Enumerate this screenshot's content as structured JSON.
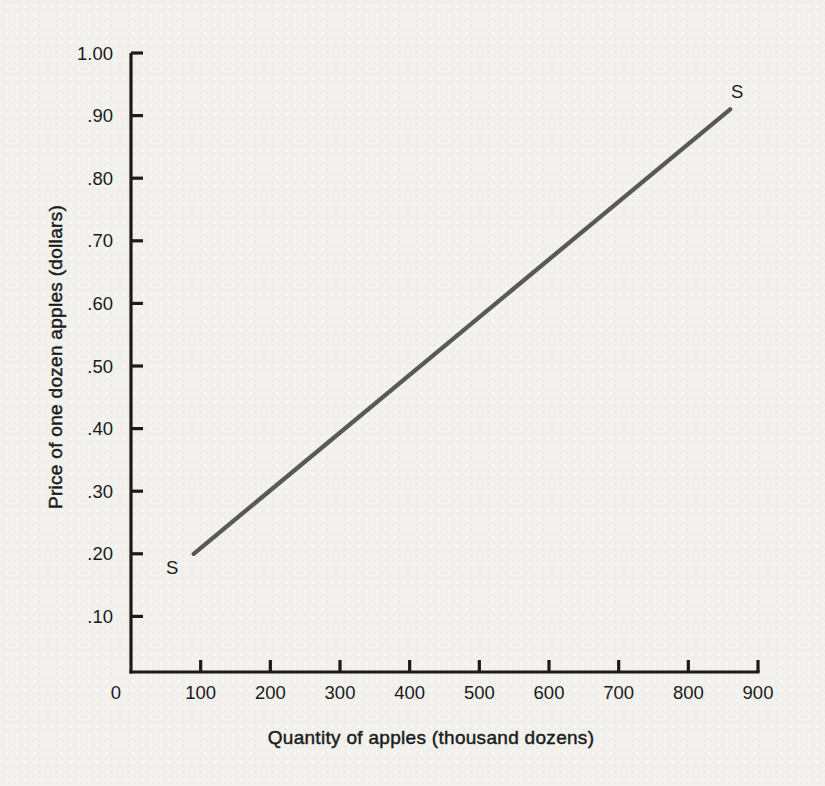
{
  "page": {
    "background_color": "#f2f1ee"
  },
  "chart_data": {
    "type": "line",
    "title": "",
    "xlabel": "Quantity of apples (thousand dozens)",
    "ylabel": "Price of one dozen apples (dollars)",
    "xlim": [
      0,
      900
    ],
    "ylim": [
      0,
      1.0
    ],
    "grid": false,
    "legend": "none",
    "axis_color": "#1b1b1b",
    "text_color": "#1b1b1b",
    "origin_label": "0",
    "x_ticks": [
      {
        "value": 100,
        "label": "100"
      },
      {
        "value": 200,
        "label": "200"
      },
      {
        "value": 300,
        "label": "300"
      },
      {
        "value": 400,
        "label": "400"
      },
      {
        "value": 500,
        "label": "500"
      },
      {
        "value": 600,
        "label": "600"
      },
      {
        "value": 700,
        "label": "700"
      },
      {
        "value": 800,
        "label": "800"
      },
      {
        "value": 900,
        "label": "900"
      }
    ],
    "y_ticks": [
      {
        "value": 1.0,
        "label": "1.00"
      },
      {
        "value": 0.9,
        "label": ".90"
      },
      {
        "value": 0.8,
        "label": ".80"
      },
      {
        "value": 0.7,
        "label": ".70"
      },
      {
        "value": 0.6,
        "label": ".60"
      },
      {
        "value": 0.5,
        "label": ".50"
      },
      {
        "value": 0.4,
        "label": ".40"
      },
      {
        "value": 0.3,
        "label": ".30"
      },
      {
        "value": 0.2,
        "label": ".20"
      },
      {
        "value": 0.1,
        "label": ".10"
      }
    ],
    "series": [
      {
        "name": "S",
        "description": "Supply curve for apples",
        "color": "#595959",
        "points": [
          [
            90,
            0.2
          ],
          [
            860,
            0.91
          ]
        ],
        "start_label": "S",
        "end_label": "S"
      }
    ]
  }
}
